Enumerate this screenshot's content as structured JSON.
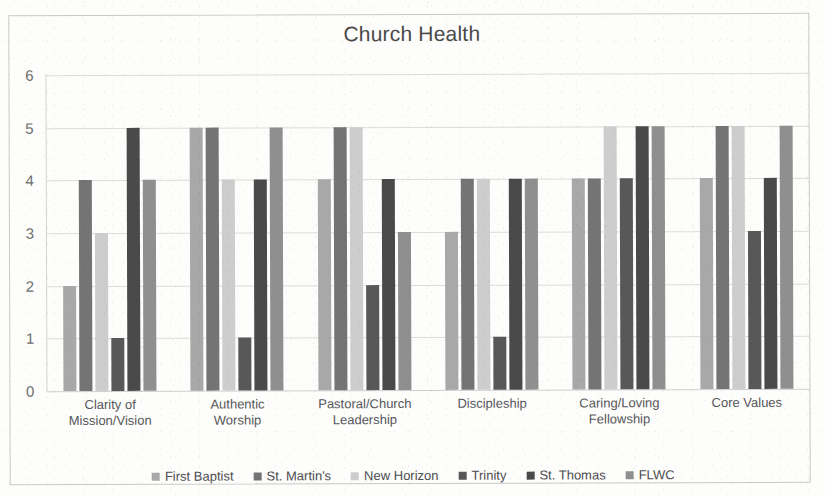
{
  "chart_data": {
    "type": "bar",
    "title": "Church Health",
    "xlabel": "",
    "ylabel": "",
    "ylim": [
      0,
      6
    ],
    "yticks": [
      0,
      1,
      2,
      3,
      4,
      5,
      6
    ],
    "grid": true,
    "legend_position": "bottom",
    "categories": [
      "Clarity of Mission/Vision",
      "Authentic Worship",
      "Pastoral/Church Leadership",
      "Discipleship",
      "Caring/Loving Fellowship",
      "Core Values"
    ],
    "category_lines": [
      [
        "Clarity of",
        "Mission/Vision"
      ],
      [
        "Authentic",
        "Worship"
      ],
      [
        "Pastoral/Church",
        "Leadership"
      ],
      [
        "Discipleship",
        ""
      ],
      [
        "Caring/Loving",
        "Fellowship"
      ],
      [
        "Core Values",
        ""
      ]
    ],
    "series": [
      {
        "name": "First Baptist",
        "color": "#a8a8a8",
        "values": [
          2,
          5,
          4,
          3,
          4,
          4
        ]
      },
      {
        "name": "St. Martin's",
        "color": "#747474",
        "values": [
          4,
          5,
          5,
          4,
          4,
          5
        ]
      },
      {
        "name": "New Horizon",
        "color": "#cdcdcd",
        "values": [
          3,
          4,
          5,
          4,
          5,
          5
        ]
      },
      {
        "name": "Trinity",
        "color": "#585858",
        "values": [
          1,
          1,
          2,
          1,
          4,
          3
        ]
      },
      {
        "name": "St. Thomas",
        "color": "#4a4a4a",
        "values": [
          5,
          4,
          4,
          4,
          5,
          4
        ]
      },
      {
        "name": "FLWC",
        "color": "#8f8f8f",
        "values": [
          4,
          5,
          3,
          4,
          5,
          5
        ]
      }
    ]
  },
  "axis": {
    "y_tick_labels": [
      "6",
      "5",
      "4",
      "3",
      "2",
      "1",
      "0"
    ]
  }
}
